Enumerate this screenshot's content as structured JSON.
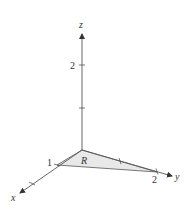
{
  "diagram": {
    "type": "3d-coordinate-axes",
    "axes": {
      "x": {
        "label": "x",
        "tick_labels": [
          "1"
        ]
      },
      "y": {
        "label": "y",
        "tick_labels": [
          "2"
        ]
      },
      "z": {
        "label": "z",
        "tick_labels": [
          "2"
        ]
      }
    },
    "region": {
      "label": "R",
      "vertices": [
        "origin",
        "(1,0,0)",
        "(0,2,0)"
      ],
      "fill": "#e6e6e6"
    },
    "colors": {
      "axis": "#555555",
      "region_fill": "#e6e6e6",
      "text": "#333333"
    }
  }
}
